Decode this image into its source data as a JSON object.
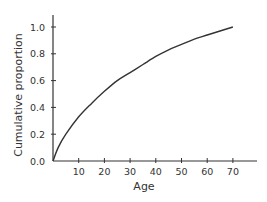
{
  "chart_data": {
    "type": "line",
    "title": "",
    "xlabel": "Age",
    "ylabel": "Cumulative proportion",
    "x_ticks": [
      10,
      20,
      30,
      40,
      50,
      60,
      70
    ],
    "y_ticks": [
      "0.0",
      "0.2",
      "0.4",
      "0.6",
      "0.8",
      "1.0"
    ],
    "xlim": [
      0,
      79
    ],
    "ylim": [
      0,
      1.08
    ],
    "grid": false,
    "legend": null,
    "series": [
      {
        "name": "Cumulative proportion",
        "color": "#333333",
        "x": [
          0,
          2,
          5,
          10,
          15,
          20,
          25,
          30,
          35,
          40,
          45,
          50,
          55,
          60,
          65,
          70
        ],
        "y": [
          0.0,
          0.1,
          0.2,
          0.33,
          0.43,
          0.52,
          0.6,
          0.66,
          0.72,
          0.78,
          0.83,
          0.87,
          0.91,
          0.94,
          0.97,
          1.0
        ]
      }
    ]
  }
}
